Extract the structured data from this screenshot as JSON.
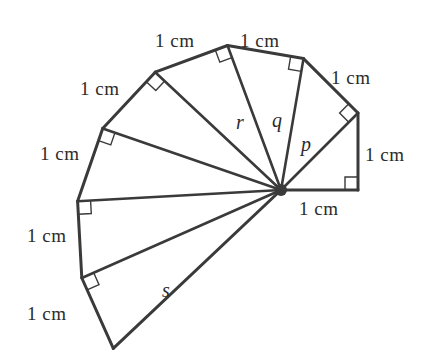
{
  "figure": {
    "stroke_color": "#3a3a3a",
    "background_color": "#ffffff",
    "text_color": "#2b2b2b",
    "width": 427,
    "height": 363
  },
  "geometry": {
    "hub": {
      "x": 281,
      "y": 190
    },
    "unit_px": 77,
    "start_angle_deg": 0,
    "spokes": [
      {
        "index": 1,
        "length_cm": 1,
        "x": 358.0,
        "y": 190.0
      },
      {
        "index": 2,
        "length_cm": 1.41421,
        "x": 358.0,
        "y": 113.0
      },
      {
        "index": 3,
        "length_cm": 1.73205,
        "x": 303.5,
        "y": 58.6
      },
      {
        "index": 4,
        "length_cm": 2,
        "x": 227.5,
        "y": 45.5
      },
      {
        "index": 5,
        "length_cm": 2.23607,
        "x": 155.2,
        "y": 72.2
      },
      {
        "index": 6,
        "length_cm": 2.44949,
        "x": 102.7,
        "y": 128.4
      },
      {
        "index": 7,
        "length_cm": 2.64575,
        "x": 77.6,
        "y": 201.2
      },
      {
        "index": 8,
        "length_cm": 2.82843,
        "x": 81.8,
        "y": 278.0
      },
      {
        "index": 9,
        "length_cm": 3,
        "x": 113.3,
        "y": 348.4
      }
    ],
    "right_angle_marker_size": 13,
    "hub_dot_radius": 6
  },
  "labels": {
    "side_lengths": [
      {
        "id": "cm-base",
        "text": "1 cm",
        "x": 299,
        "y": 199
      },
      {
        "id": "cm-right",
        "text": "1 cm",
        "x": 365,
        "y": 145
      },
      {
        "id": "cm-upright",
        "text": "1 cm",
        "x": 331,
        "y": 68
      },
      {
        "id": "cm-topright",
        "text": "1 cm",
        "x": 240,
        "y": 31
      },
      {
        "id": "cm-topleft",
        "text": "1 cm",
        "x": 155,
        "y": 31
      },
      {
        "id": "cm-upleft",
        "text": "1 cm",
        "x": 80,
        "y": 79
      },
      {
        "id": "cm-left",
        "text": "1 cm",
        "x": 40,
        "y": 144
      },
      {
        "id": "cm-lowleft",
        "text": "1 cm",
        "x": 27,
        "y": 226
      },
      {
        "id": "cm-bottom",
        "text": "1 cm",
        "x": 27,
        "y": 304
      }
    ],
    "variables": [
      {
        "id": "var-p",
        "text": "p",
        "x": 301,
        "y": 134
      },
      {
        "id": "var-q",
        "text": "q",
        "x": 272,
        "y": 110
      },
      {
        "id": "var-r",
        "text": "r",
        "x": 236,
        "y": 112
      },
      {
        "id": "var-s",
        "text": "s",
        "x": 162,
        "y": 280
      }
    ]
  }
}
